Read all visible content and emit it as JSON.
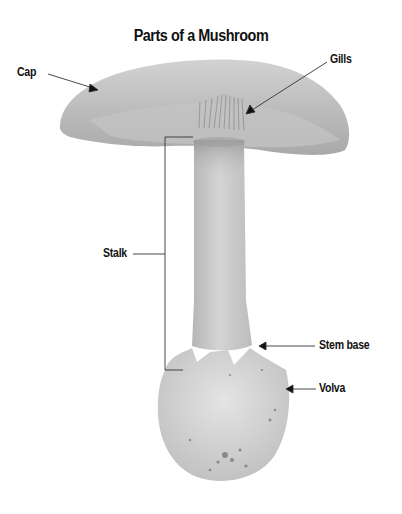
{
  "title": "Parts of a Mushroom",
  "labels": {
    "cap": "Cap",
    "gills": "Gills",
    "stalk": "Stalk",
    "stem_base": "Stem base",
    "volva": "Volva"
  },
  "colors": {
    "background": "#ffffff",
    "text": "#111111",
    "leader_line": "#333333",
    "cap": "#b9b9b9",
    "stalk": "#c8c8c8",
    "volva": "#d9d9d9"
  }
}
